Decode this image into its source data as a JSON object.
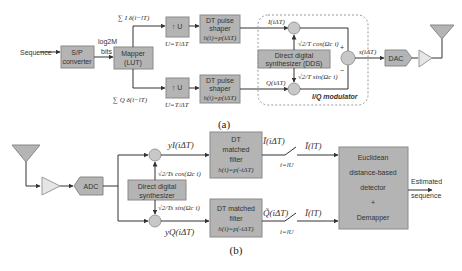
{
  "diagram_a": {
    "caption": "(a)",
    "input_label": "Sequence",
    "sp_converter": [
      "S/P",
      "converter"
    ],
    "bits_label": [
      "log2M",
      "bits"
    ],
    "mapper": [
      "Mapper",
      "(LUT)"
    ],
    "i_sum": "∑ I δ(i−lT)",
    "q_sum": "∑ Q δ(i−lT)",
    "upsample_i": "↑ U",
    "upsample_q": "↑ U",
    "upsample_note_i": "U=T/ΔT",
    "upsample_note_q": "U=T/ΔT",
    "pulse_shaper_i": [
      "DT pulse",
      "shaper",
      "h(i)=p(iΔT)"
    ],
    "pulse_shaper_q": [
      "DT pulse",
      "shaper",
      "h(i)=p(iΔT)"
    ],
    "i_signal": "I(iΔT)",
    "q_signal": "Q(iΔT)",
    "dds": [
      "Direct digital",
      "synthesizer (DDS)"
    ],
    "cos_term": "√2/T cos(Ωc i)",
    "sin_term": "√2/T sin(Ωc i)",
    "plus": "+",
    "minus": "−",
    "output_signal": "s(iΔT)",
    "dac": "DAC",
    "modulator_label": "I/Q modulator"
  },
  "diagram_b": {
    "caption": "(b)",
    "adc": "ADC",
    "dds": [
      "Direct digital",
      "synthesizer"
    ],
    "yi": "yI(iΔT)",
    "yq": "yQ(iΔT)",
    "cos_term": "√2/Ts cos(Ωc i)",
    "sin_term": "√2/Ts sin(Ωc i)",
    "matched_filter_i": [
      "DT",
      "matched",
      "filter",
      "h(i)=p(-iΔT)"
    ],
    "matched_filter_q": [
      "DT matched",
      "filter",
      "h(i)=p(-iΔT)"
    ],
    "i_tilde": "Ĩ(iΔT)",
    "q_tilde": "Q̃(iΔT)",
    "sample_i": "i=lU",
    "sample_q": "i=lU",
    "i_out": "Ĩ(lT)",
    "q_out": "Ĩ(lT)",
    "detector": [
      "Euclidean",
      "distance-based",
      "detector",
      "+",
      "Demapper"
    ],
    "output_label": [
      "Estimated",
      "sequence"
    ]
  },
  "colors": {
    "box": "#b4b4b4",
    "line": "#333333",
    "amp": "#e6e6e6",
    "dashed": "#999999"
  }
}
